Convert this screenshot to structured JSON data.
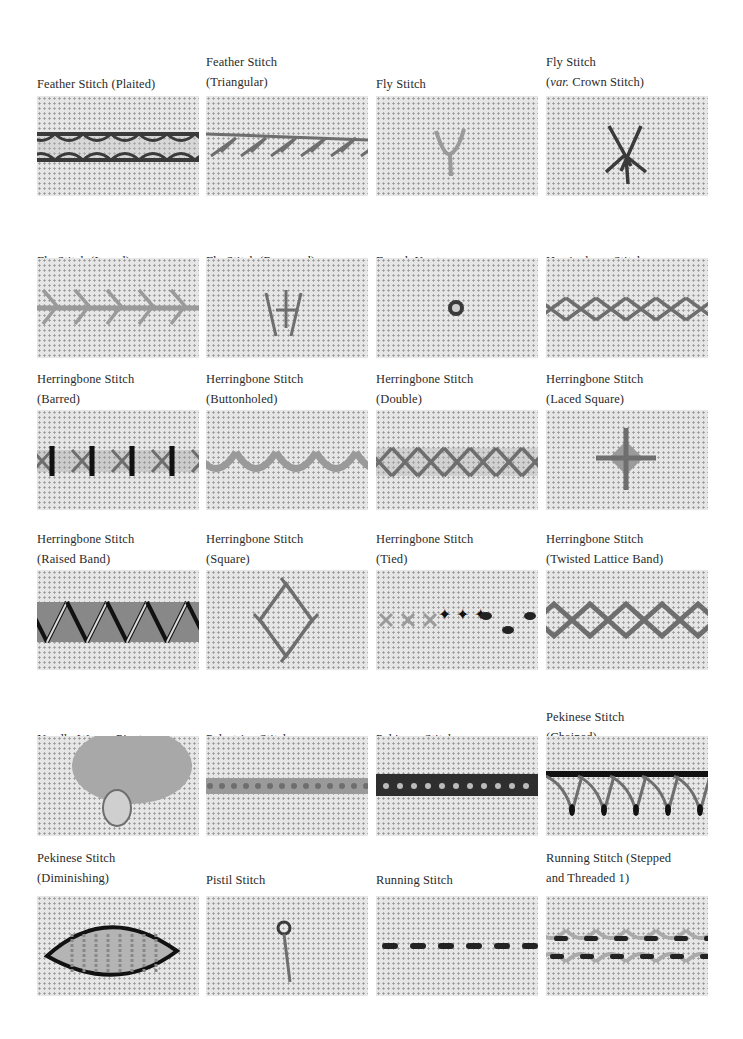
{
  "page": {
    "entries": [
      {
        "line1": "Feather Stitch (Plaited)",
        "line2": "",
        "page": "127",
        "col": 0,
        "row": 0,
        "image": "feather-stitch-plaited"
      },
      {
        "line1": "Feather Stitch",
        "line2": "(Triangular)",
        "page": "130",
        "col": 1,
        "row": 0,
        "image": "feather-stitch-triangular"
      },
      {
        "line1": "Fly Stitch",
        "line2": "",
        "page": "131",
        "col": 2,
        "row": 0,
        "image": "fly-stitch"
      },
      {
        "line1": "Fly Stitch",
        "line2": "(var. Crown Stitch)",
        "page": "132",
        "col": 3,
        "row": 0,
        "image": "fly-stitch-crown"
      },
      {
        "line1": "Fly Stitch (Laced)",
        "line2": "",
        "page": "133",
        "col": 0,
        "row": 1,
        "image": "fly-stitch-laced"
      },
      {
        "line1": "Fly Stitch (Reversed)",
        "line2": "",
        "page": "134",
        "col": 1,
        "row": 1,
        "image": "fly-stitch-reversed"
      },
      {
        "line1": "French Knot",
        "line2": "",
        "page": "135",
        "col": 2,
        "row": 1,
        "image": "french-knot"
      },
      {
        "line1": "Herringbone Stitch",
        "line2": "",
        "page": "136",
        "col": 3,
        "row": 1,
        "image": "herringbone-stitch"
      },
      {
        "line1": "Herringbone Stitch",
        "line2": "(Barred)",
        "page": "138",
        "col": 0,
        "row": 2,
        "image": "herringbone-barred"
      },
      {
        "line1": "Herringbone Stitch",
        "line2": "(Buttonholed)",
        "page": "139",
        "col": 1,
        "row": 2,
        "image": "herringbone-buttonholed"
      },
      {
        "line1": "Herringbone Stitch",
        "line2": "(Double)",
        "page": "140",
        "col": 2,
        "row": 2,
        "image": "herringbone-double"
      },
      {
        "line1": "Herringbone Stitch",
        "line2": "(Laced Square)",
        "page": "141",
        "col": 3,
        "row": 2,
        "image": "herringbone-laced-square"
      },
      {
        "line1": "Herringbone Stitch",
        "line2": "(Raised Band)",
        "page": "142",
        "col": 0,
        "row": 3,
        "image": "herringbone-raised-band"
      },
      {
        "line1": "Herringbone Stitch",
        "line2": "(Square)",
        "page": "144",
        "col": 1,
        "row": 3,
        "image": "herringbone-square"
      },
      {
        "line1": "Herringbone Stitch",
        "line2": "(Tied)",
        "page": "145",
        "col": 2,
        "row": 3,
        "image": "herringbone-tied"
      },
      {
        "line1": "Herringbone Stitch",
        "line2": "(Twisted Lattice Band)",
        "page": "146",
        "col": 3,
        "row": 3,
        "image": "herringbone-twisted-lattice"
      },
      {
        "line1": "Needle-Woven Picot",
        "line2": "",
        "page": "148",
        "col": 0,
        "row": 4,
        "image": "needle-woven-picot"
      },
      {
        "line1": "Palestrina Stitch",
        "line2": "",
        "page": "150",
        "col": 1,
        "row": 4,
        "image": "palestrina-stitch"
      },
      {
        "line1": "Pekinese Stitch",
        "line2": "",
        "page": "151",
        "col": 2,
        "row": 4,
        "image": "pekinese-stitch"
      },
      {
        "line1": "Pekinese Stitch",
        "line2": "(Chained)",
        "page": "152",
        "col": 3,
        "row": 4,
        "image": "pekinese-chained"
      },
      {
        "line1": "Pekinese Stitch",
        "line2": "(Diminishing)",
        "page": "154",
        "col": 0,
        "row": 5,
        "image": "pekinese-diminishing"
      },
      {
        "line1": "Pistil Stitch",
        "line2": "",
        "page": "155",
        "col": 1,
        "row": 5,
        "image": "pistil-stitch"
      },
      {
        "line1": "Running Stitch",
        "line2": "",
        "page": "156",
        "col": 2,
        "row": 5,
        "image": "running-stitch"
      },
      {
        "line1": "Running Stitch (Stepped",
        "line2": "and Threaded 1)",
        "page": "157",
        "col": 3,
        "row": 5,
        "image": "running-stitch-stepped-threaded"
      }
    ]
  }
}
